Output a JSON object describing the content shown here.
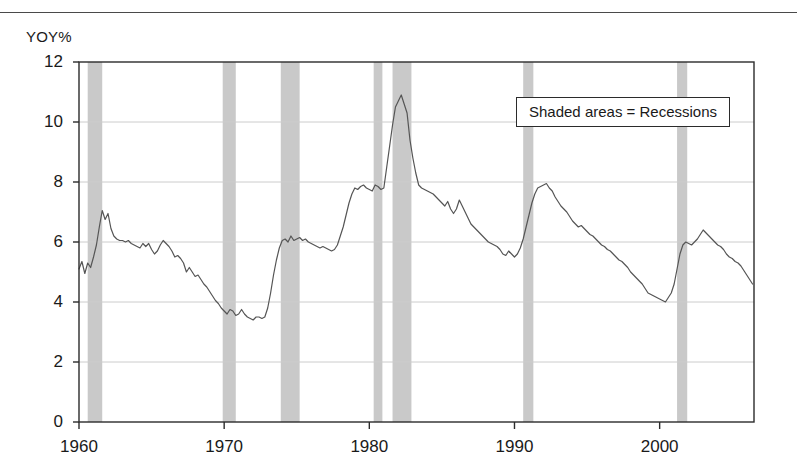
{
  "figure": {
    "unit_label": "YOY%",
    "legend_text": "Shaded areas = Recessions",
    "line_color": "#555555",
    "shade_color": "#c9c9c9",
    "frame_color": "#2b2b2b",
    "grid_color": "#cccccc"
  },
  "chart_data": {
    "type": "line",
    "title": "",
    "subtitle": "",
    "xlabel": "",
    "ylabel": "YOY%",
    "ylim": [
      0,
      12
    ],
    "xlim": [
      1960,
      2006.5
    ],
    "grid": true,
    "legend_position": "top-right",
    "annotations": [
      {
        "text": "Shaded areas = Recessions",
        "type": "legend-box",
        "x": 1989.5,
        "y": 11.1
      }
    ],
    "yticks": [
      0,
      2,
      4,
      6,
      8,
      10,
      12
    ],
    "ytick_labels": [
      "0",
      "2",
      "4",
      "6",
      "8",
      "10",
      "12"
    ],
    "xticks": [
      1960,
      1970,
      1980,
      1990,
      2000
    ],
    "xtick_labels": [
      "1960",
      "1970",
      "1980",
      "1990",
      "2000"
    ],
    "shaded_regions": [
      {
        "label": "Recession 1960-61",
        "x0": 1960.6,
        "x1": 1961.6
      },
      {
        "label": "Recession 1970",
        "x0": 1969.9,
        "x1": 1970.8
      },
      {
        "label": "Recession 1973-75",
        "x0": 1973.9,
        "x1": 1975.2
      },
      {
        "label": "Recession 1980",
        "x0": 1980.3,
        "x1": 1980.9
      },
      {
        "label": "Recession 1981-82",
        "x0": 1981.6,
        "x1": 1982.9
      },
      {
        "label": "Recession 1990-91",
        "x0": 1990.6,
        "x1": 1991.3
      },
      {
        "label": "Recession 2001",
        "x0": 2001.2,
        "x1": 2001.9
      }
    ],
    "series": [
      {
        "name": "YOY%",
        "x": [
          1960.0,
          1960.2,
          1960.4,
          1960.6,
          1960.8,
          1961.0,
          1961.2,
          1961.4,
          1961.6,
          1961.8,
          1962.0,
          1962.2,
          1962.4,
          1962.6,
          1962.8,
          1963.0,
          1963.2,
          1963.4,
          1963.6,
          1963.8,
          1964.0,
          1964.2,
          1964.4,
          1964.6,
          1964.8,
          1965.0,
          1965.2,
          1965.4,
          1965.6,
          1965.8,
          1966.0,
          1966.2,
          1966.4,
          1966.6,
          1966.8,
          1967.0,
          1967.2,
          1967.4,
          1967.6,
          1967.8,
          1968.0,
          1968.2,
          1968.4,
          1968.6,
          1968.8,
          1969.0,
          1969.2,
          1969.4,
          1969.6,
          1969.8,
          1970.0,
          1970.2,
          1970.4,
          1970.6,
          1970.8,
          1971.0,
          1971.2,
          1971.4,
          1971.6,
          1971.8,
          1972.0,
          1972.2,
          1972.4,
          1972.6,
          1972.8,
          1973.0,
          1973.2,
          1973.4,
          1973.6,
          1973.8,
          1974.0,
          1974.2,
          1974.4,
          1974.6,
          1974.8,
          1975.0,
          1975.2,
          1975.4,
          1975.6,
          1975.8,
          1976.0,
          1976.2,
          1976.4,
          1976.6,
          1976.8,
          1977.0,
          1977.2,
          1977.4,
          1977.6,
          1977.8,
          1978.0,
          1978.2,
          1978.4,
          1978.6,
          1978.8,
          1979.0,
          1979.2,
          1979.4,
          1979.6,
          1979.8,
          1980.0,
          1980.2,
          1980.4,
          1980.6,
          1980.8,
          1981.0,
          1981.2,
          1981.4,
          1981.6,
          1981.8,
          1982.0,
          1982.2,
          1982.4,
          1982.6,
          1982.8,
          1983.0,
          1983.2,
          1983.4,
          1983.6,
          1983.8,
          1984.0,
          1984.2,
          1984.4,
          1984.6,
          1984.8,
          1985.0,
          1985.2,
          1985.4,
          1985.6,
          1985.8,
          1986.0,
          1986.2,
          1986.4,
          1986.6,
          1986.8,
          1987.0,
          1987.2,
          1987.4,
          1987.6,
          1987.8,
          1988.0,
          1988.2,
          1988.4,
          1988.6,
          1988.8,
          1989.0,
          1989.2,
          1989.4,
          1989.6,
          1989.8,
          1990.0,
          1990.2,
          1990.4,
          1990.6,
          1990.8,
          1991.0,
          1991.2,
          1991.4,
          1991.6,
          1991.8,
          1992.0,
          1992.2,
          1992.4,
          1992.6,
          1992.8,
          1993.0,
          1993.2,
          1993.4,
          1993.6,
          1993.8,
          1994.0,
          1994.2,
          1994.4,
          1994.6,
          1994.8,
          1995.0,
          1995.2,
          1995.4,
          1995.6,
          1995.8,
          1996.0,
          1996.2,
          1996.4,
          1996.6,
          1996.8,
          1997.0,
          1997.2,
          1997.4,
          1997.6,
          1997.8,
          1998.0,
          1998.2,
          1998.4,
          1998.6,
          1998.8,
          1999.0,
          1999.2,
          1999.4,
          1999.6,
          1999.8,
          2000.0,
          2000.2,
          2000.4,
          2000.6,
          2000.8,
          2001.0,
          2001.2,
          2001.4,
          2001.6,
          2001.8,
          2002.0,
          2002.2,
          2002.4,
          2002.6,
          2002.8,
          2003.0,
          2003.2,
          2003.4,
          2003.6,
          2003.8,
          2004.0,
          2004.2,
          2004.4,
          2004.6,
          2004.8,
          2005.0,
          2005.2,
          2005.4,
          2005.6,
          2005.8,
          2006.0,
          2006.2,
          2006.4
        ],
        "values": [
          5.1,
          5.35,
          4.95,
          5.3,
          5.15,
          5.5,
          5.9,
          6.5,
          7.05,
          6.75,
          6.95,
          6.45,
          6.2,
          6.1,
          6.05,
          6.05,
          6.0,
          6.05,
          5.95,
          5.9,
          5.85,
          5.8,
          5.95,
          5.85,
          5.95,
          5.75,
          5.6,
          5.7,
          5.9,
          6.05,
          5.95,
          5.85,
          5.7,
          5.5,
          5.55,
          5.45,
          5.3,
          5.0,
          5.15,
          5.0,
          4.85,
          4.9,
          4.75,
          4.6,
          4.5,
          4.35,
          4.2,
          4.05,
          3.95,
          3.8,
          3.7,
          3.6,
          3.75,
          3.7,
          3.55,
          3.6,
          3.75,
          3.6,
          3.5,
          3.45,
          3.4,
          3.5,
          3.5,
          3.45,
          3.5,
          3.8,
          4.3,
          4.9,
          5.4,
          5.8,
          6.05,
          6.1,
          6.0,
          6.2,
          6.05,
          6.1,
          6.15,
          6.05,
          6.1,
          6.0,
          5.95,
          5.9,
          5.85,
          5.8,
          5.85,
          5.8,
          5.75,
          5.7,
          5.75,
          5.9,
          6.2,
          6.5,
          6.9,
          7.3,
          7.6,
          7.8,
          7.75,
          7.85,
          7.9,
          7.8,
          7.75,
          7.7,
          7.9,
          7.85,
          7.75,
          7.8,
          8.5,
          9.2,
          9.9,
          10.5,
          10.7,
          10.9,
          10.6,
          10.3,
          9.4,
          8.8,
          8.3,
          7.9,
          7.8,
          7.75,
          7.7,
          7.65,
          7.6,
          7.5,
          7.4,
          7.3,
          7.2,
          7.35,
          7.1,
          6.95,
          7.1,
          7.4,
          7.2,
          7.0,
          6.8,
          6.6,
          6.5,
          6.4,
          6.3,
          6.2,
          6.1,
          6.0,
          5.95,
          5.9,
          5.85,
          5.75,
          5.6,
          5.55,
          5.7,
          5.6,
          5.5,
          5.6,
          5.8,
          6.1,
          6.5,
          6.9,
          7.3,
          7.6,
          7.8,
          7.85,
          7.9,
          7.95,
          7.8,
          7.7,
          7.5,
          7.35,
          7.2,
          7.1,
          7.0,
          6.85,
          6.7,
          6.6,
          6.5,
          6.55,
          6.45,
          6.35,
          6.25,
          6.2,
          6.1,
          6.0,
          5.9,
          5.85,
          5.75,
          5.7,
          5.6,
          5.5,
          5.4,
          5.35,
          5.25,
          5.15,
          5.0,
          4.9,
          4.8,
          4.7,
          4.6,
          4.45,
          4.3,
          4.25,
          4.2,
          4.15,
          4.1,
          4.05,
          4.0,
          4.15,
          4.3,
          4.6,
          5.1,
          5.6,
          5.9,
          6.0,
          5.95,
          5.9,
          6.0,
          6.1,
          6.25,
          6.4,
          6.3,
          6.2,
          6.1,
          6.0,
          5.9,
          5.85,
          5.75,
          5.6,
          5.5,
          5.45,
          5.35,
          5.3,
          5.2,
          5.05,
          4.9,
          4.75,
          4.6
        ]
      }
    ]
  }
}
